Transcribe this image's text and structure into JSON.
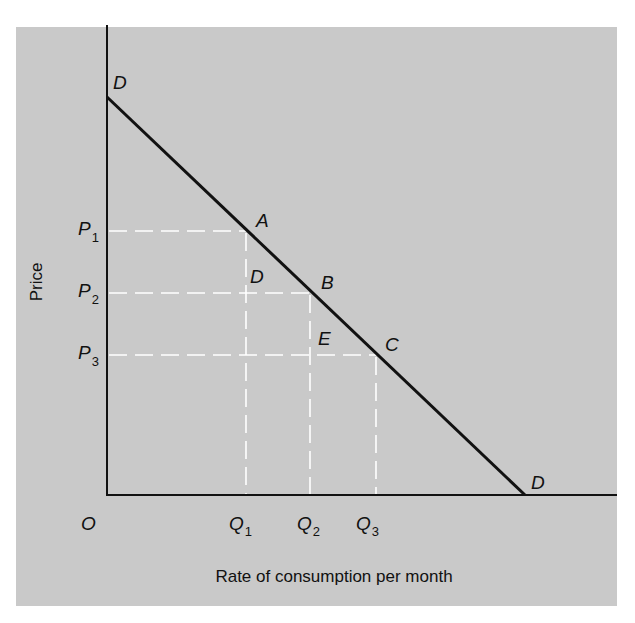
{
  "diagram": {
    "y_axis_label": "Price",
    "x_axis_label": "Rate of consumption per month",
    "origin_label": "O",
    "curve_label_top": "D",
    "curve_label_bottom": "D",
    "points": {
      "A": "A",
      "B": "B",
      "C": "C",
      "D": "D",
      "E": "E"
    },
    "price_levels": [
      {
        "base": "P",
        "sub": "1"
      },
      {
        "base": "P",
        "sub": "2"
      },
      {
        "base": "P",
        "sub": "3"
      }
    ],
    "quantity_levels": [
      {
        "base": "Q",
        "sub": "1"
      },
      {
        "base": "Q",
        "sub": "2"
      },
      {
        "base": "Q",
        "sub": "3"
      }
    ],
    "colors": {
      "panel": "#c9c9c9",
      "line": "#111111",
      "dashed": "#ffffff"
    }
  }
}
